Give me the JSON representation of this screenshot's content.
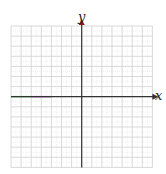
{
  "diagram": {
    "type": "coordinate-grid",
    "x_axis_label": "x",
    "y_axis_label": "y",
    "grid": {
      "columns": 14,
      "rows": 14,
      "line_color": "#cfcfcf",
      "minor_color": "#e6e6e6"
    },
    "axis_color": "#333333",
    "arrow_color": "#8b1a1a",
    "segments": [
      {
        "name": "green-segment",
        "color": "#7fd67f",
        "from_col": 0,
        "to_col": 2
      },
      {
        "name": "magenta-segment",
        "color": "#c77bd0",
        "from_col": 2,
        "to_col": 4
      }
    ]
  }
}
